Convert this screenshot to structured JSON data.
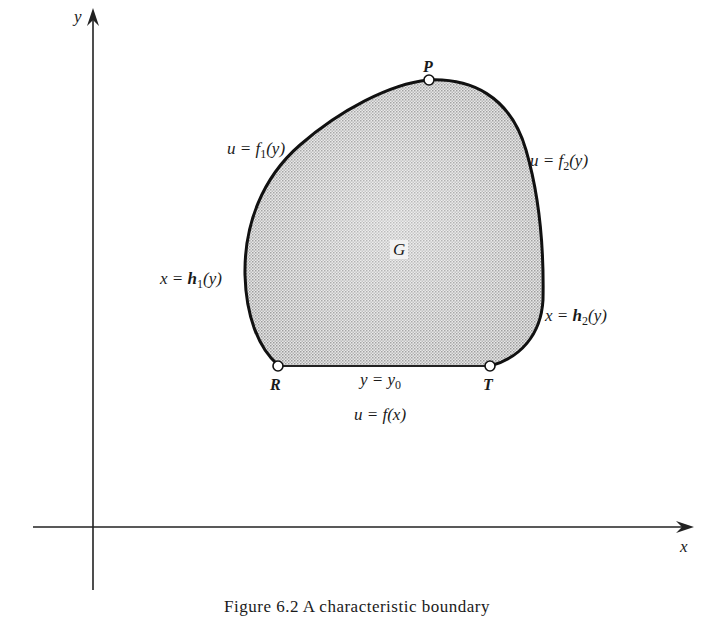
{
  "figure": {
    "axes": {
      "x_label": "x",
      "y_label": "y"
    },
    "region": {
      "label": "G",
      "fill_color": "#d9d9d9",
      "stroke_color": "#111111"
    },
    "points": {
      "P": "P",
      "R": "R",
      "T": "T"
    },
    "boundary_labels": {
      "upper_left": {
        "lhs": "u = f",
        "sub": "1",
        "rhs": "(y)"
      },
      "upper_right": {
        "lhs": "u = f",
        "sub": "2",
        "rhs": "(y)"
      },
      "left": {
        "lhs": "x = ",
        "bold": "h",
        "sub": "1",
        "rhs": "(y)"
      },
      "right": {
        "lhs": "x = ",
        "bold": "h",
        "sub": "2",
        "rhs": "(y)"
      },
      "bottom_line": {
        "lhs": "y = y",
        "sub": "0"
      },
      "bottom_condition": "u = f(x)"
    },
    "caption": "Figure 6.2   A characteristic boundary"
  }
}
